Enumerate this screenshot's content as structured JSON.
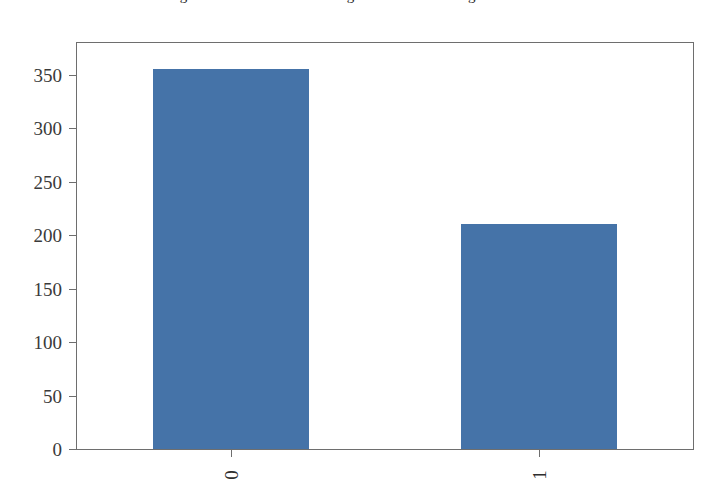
{
  "figure": {
    "background_color": "#ffffff",
    "frame_color": "#6e6e6e",
    "clipped_caption_above": "Figure: distribution of the target variable showing class counts"
  },
  "chart_data": {
    "type": "bar",
    "title": "",
    "subtitle": "",
    "xlabel": "",
    "ylabel": "",
    "categories": [
      "0",
      "1"
    ],
    "values": [
      356,
      211
    ],
    "series": [
      {
        "name": "count",
        "values": [
          356,
          211
        ],
        "color": "#4573a8"
      }
    ],
    "ylim": [
      0,
      380
    ],
    "xlim": [
      0,
      2
    ],
    "yticks": [
      0,
      50,
      100,
      150,
      200,
      250,
      300,
      350
    ],
    "ytick_labels": [
      "0",
      "50",
      "100",
      "150",
      "200",
      "250",
      "300",
      "350"
    ],
    "xtick_labels": [
      "0",
      "1"
    ],
    "xtick_label_rotation": 90,
    "grid": false,
    "legend": false,
    "legend_position": "none",
    "bar_color": "#4573a8",
    "bar_edge_color": "#4573a8",
    "annotations": []
  }
}
